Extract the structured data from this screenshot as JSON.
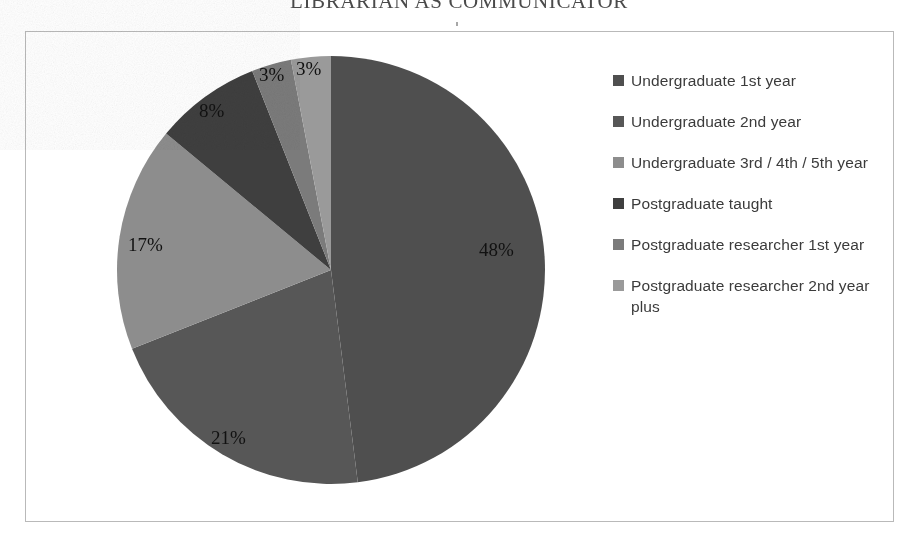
{
  "document": {
    "running_head": "LIBRARIAN AS COMMUNICATOR"
  },
  "chart_frame": {
    "border_color": "#b9b9b9",
    "background": "#ffffff"
  },
  "legend": {
    "position": "right",
    "items": [
      {
        "label": "Undergraduate 1st year",
        "color": "#4f4f4f"
      },
      {
        "label": "Undergraduate 2nd year",
        "color": "#575757"
      },
      {
        "label": "Undergraduate 3rd / 4th / 5th year",
        "color": "#8d8d8d"
      },
      {
        "label": "Postgraduate taught",
        "color": "#3f3f3f"
      },
      {
        "label": "Postgraduate researcher 1st year",
        "color": "#7b7b7b"
      },
      {
        "label": "Postgraduate researcher 2nd year plus",
        "color": "#9a9a9a"
      }
    ]
  },
  "chart_data": {
    "type": "pie",
    "title": "",
    "categories": [
      "Undergraduate 1st year",
      "Undergraduate 2nd year",
      "Undergraduate 3rd / 4th / 5th year",
      "Postgraduate taught",
      "Postgraduate researcher 1st year",
      "Postgraduate researcher 2nd year plus"
    ],
    "values": [
      48,
      21,
      17,
      8,
      3,
      3
    ],
    "value_unit": "%",
    "data_labels": [
      "48%",
      "21%",
      "17%",
      "8%",
      "3%",
      "3%"
    ],
    "colors": [
      "#4f4f4f",
      "#575757",
      "#8d8d8d",
      "#3f3f3f",
      "#7b7b7b",
      "#9a9a9a"
    ],
    "start_angle_deg": 0,
    "direction": "clockwise",
    "legend_position": "right",
    "grid": false,
    "xlabel": "",
    "ylabel": ""
  },
  "pie_geometry": {
    "center_x": 235,
    "center_y": 235,
    "radius": 214
  },
  "label_positions": [
    {
      "text": "48%",
      "left": 383,
      "top": 204
    },
    {
      "text": "21%",
      "left": 115,
      "top": 392
    },
    {
      "text": "17%",
      "left": 32,
      "top": 199
    },
    {
      "text": "8%",
      "left": 103,
      "top": 65
    },
    {
      "text": "3%",
      "left": 163,
      "top": 29
    },
    {
      "text": "3%",
      "left": 200,
      "top": 23
    }
  ]
}
